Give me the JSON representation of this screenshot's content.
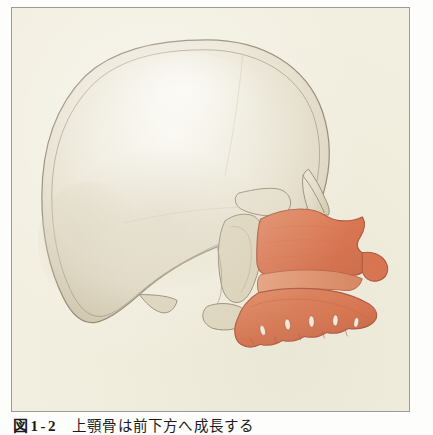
{
  "figure": {
    "plate_background": "#f4f1e3",
    "frame_border_color": "#9a9a96",
    "page_background": "#fdfdfb",
    "alt_description": "Lateral view of a human skull with the maxilla highlighted in orange",
    "caption": {
      "label": "図1-2",
      "text": "上顎骨は前下方へ成長する"
    }
  },
  "illustration": {
    "type": "anatomical-line-drawing",
    "view": "lateral",
    "subject": "human-skull",
    "colors": {
      "bone_light": "#ece6d7",
      "bone_mid": "#ddd5c2",
      "bone_shadow": "#c8bda5",
      "bone_highlight": "#f7f4ea",
      "outline": "#8a7f6c",
      "maxilla_fill": "#dd6b45",
      "maxilla_light": "#e79070",
      "maxilla_dark": "#c4543a",
      "maxilla_outline": "#a8452f",
      "tooth_white": "#f6f2e6"
    },
    "regions": [
      {
        "name": "cranial-vault",
        "highlighted": false
      },
      {
        "name": "frontal-bone",
        "highlighted": false
      },
      {
        "name": "occipital-bone",
        "highlighted": false
      },
      {
        "name": "temporal-bone",
        "highlighted": false
      },
      {
        "name": "mastoid-process",
        "highlighted": false
      },
      {
        "name": "zygomatic-arch",
        "highlighted": false
      },
      {
        "name": "nasal-bone",
        "highlighted": false
      },
      {
        "name": "maxilla",
        "highlighted": true
      },
      {
        "name": "alveolar-process",
        "highlighted": true
      },
      {
        "name": "maxillary-teeth",
        "highlighted": true,
        "count": 5
      }
    ]
  }
}
